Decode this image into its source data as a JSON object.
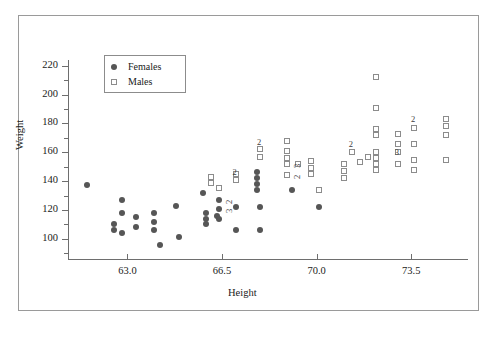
{
  "chart_data": {
    "type": "scatter",
    "title": "",
    "xlabel": "Height",
    "ylabel": "Weight",
    "xlim": [
      60.8,
      75.6
    ],
    "ylim": [
      86,
      224
    ],
    "xticks": [
      "63.0",
      "66.5",
      "70.0",
      "73.5"
    ],
    "xtick_values": [
      63.0,
      66.5,
      70.0,
      73.5
    ],
    "yticks": [
      "100",
      "120",
      "140",
      "160",
      "180",
      "200",
      "220"
    ],
    "ytick_values": [
      100,
      120,
      140,
      160,
      180,
      200,
      220
    ],
    "minor_tick_step_y": 10,
    "grid": false,
    "legend_position": "top-left",
    "series": [
      {
        "name": "Females",
        "marker": "filled-circle",
        "color": "#565656",
        "points": [
          {
            "x": 61.5,
            "y": 137,
            "n": 1
          },
          {
            "x": 62.5,
            "y": 110,
            "n": 1
          },
          {
            "x": 62.5,
            "y": 106,
            "n": 1
          },
          {
            "x": 62.8,
            "y": 127,
            "n": 1
          },
          {
            "x": 62.8,
            "y": 118,
            "n": 1
          },
          {
            "x": 62.8,
            "y": 104,
            "n": 1
          },
          {
            "x": 63.3,
            "y": 115,
            "n": 1
          },
          {
            "x": 63.3,
            "y": 108,
            "n": 1
          },
          {
            "x": 64.0,
            "y": 118,
            "n": 1
          },
          {
            "x": 64.0,
            "y": 112,
            "n": 1
          },
          {
            "x": 64.0,
            "y": 106,
            "n": 1
          },
          {
            "x": 64.2,
            "y": 96,
            "n": 1
          },
          {
            "x": 64.8,
            "y": 123,
            "n": 1
          },
          {
            "x": 64.9,
            "y": 101,
            "n": 1
          },
          {
            "x": 65.8,
            "y": 132,
            "n": 1
          },
          {
            "x": 65.9,
            "y": 118,
            "n": 1
          },
          {
            "x": 65.9,
            "y": 114,
            "n": 1
          },
          {
            "x": 65.9,
            "y": 110,
            "n": 1
          },
          {
            "x": 66.3,
            "y": 116,
            "n": 1
          },
          {
            "x": 66.4,
            "y": 127,
            "n": 2
          },
          {
            "x": 66.4,
            "y": 121,
            "n": 3
          },
          {
            "x": 66.4,
            "y": 114,
            "n": 1
          },
          {
            "x": 67.0,
            "y": 122,
            "n": 1
          },
          {
            "x": 67.0,
            "y": 106,
            "n": 1
          },
          {
            "x": 67.8,
            "y": 146,
            "n": 1
          },
          {
            "x": 67.8,
            "y": 142,
            "n": 1
          },
          {
            "x": 67.8,
            "y": 138,
            "n": 1
          },
          {
            "x": 67.8,
            "y": 134,
            "n": 1
          },
          {
            "x": 67.9,
            "y": 122,
            "n": 1
          },
          {
            "x": 67.9,
            "y": 106,
            "n": 1
          },
          {
            "x": 69.1,
            "y": 134,
            "n": 1
          },
          {
            "x": 70.1,
            "y": 122,
            "n": 1
          }
        ]
      },
      {
        "name": "Males",
        "marker": "open-square",
        "color": "#8c8c8c",
        "points": [
          {
            "x": 66.1,
            "y": 143,
            "n": 1
          },
          {
            "x": 66.1,
            "y": 139,
            "n": 1
          },
          {
            "x": 66.4,
            "y": 135,
            "n": 1
          },
          {
            "x": 67.0,
            "y": 145,
            "n": 1
          },
          {
            "x": 67.0,
            "y": 141,
            "n": 2
          },
          {
            "x": 67.9,
            "y": 162,
            "n": 1
          },
          {
            "x": 67.9,
            "y": 157,
            "n": 2
          },
          {
            "x": 68.9,
            "y": 168,
            "n": 1
          },
          {
            "x": 68.9,
            "y": 161,
            "n": 1
          },
          {
            "x": 68.9,
            "y": 156,
            "n": 1
          },
          {
            "x": 68.9,
            "y": 152,
            "n": 3
          },
          {
            "x": 68.9,
            "y": 144,
            "n": 2
          },
          {
            "x": 69.3,
            "y": 152,
            "n": 1
          },
          {
            "x": 69.8,
            "y": 154,
            "n": 1
          },
          {
            "x": 69.8,
            "y": 149,
            "n": 1
          },
          {
            "x": 69.8,
            "y": 145,
            "n": 1
          },
          {
            "x": 70.1,
            "y": 134,
            "n": 1
          },
          {
            "x": 71.0,
            "y": 152,
            "n": 1
          },
          {
            "x": 71.0,
            "y": 147,
            "n": 1
          },
          {
            "x": 71.0,
            "y": 142,
            "n": 1
          },
          {
            "x": 71.3,
            "y": 160,
            "n": 2
          },
          {
            "x": 71.9,
            "y": 157,
            "n": 1
          },
          {
            "x": 72.2,
            "y": 212,
            "n": 1
          },
          {
            "x": 72.2,
            "y": 191,
            "n": 1
          },
          {
            "x": 72.2,
            "y": 176,
            "n": 1
          },
          {
            "x": 72.2,
            "y": 172,
            "n": 1
          },
          {
            "x": 72.2,
            "y": 160,
            "n": 1
          },
          {
            "x": 72.2,
            "y": 156,
            "n": 1
          },
          {
            "x": 72.2,
            "y": 152,
            "n": 1
          },
          {
            "x": 72.2,
            "y": 148,
            "n": 1
          },
          {
            "x": 71.6,
            "y": 153,
            "n": 1
          },
          {
            "x": 73.0,
            "y": 173,
            "n": 1
          },
          {
            "x": 73.0,
            "y": 166,
            "n": 1
          },
          {
            "x": 73.0,
            "y": 160,
            "n": 3
          },
          {
            "x": 73.0,
            "y": 152,
            "n": 1
          },
          {
            "x": 73.6,
            "y": 177,
            "n": 2
          },
          {
            "x": 73.6,
            "y": 166,
            "n": 1
          },
          {
            "x": 73.6,
            "y": 155,
            "n": 1
          },
          {
            "x": 73.6,
            "y": 148,
            "n": 1
          },
          {
            "x": 74.8,
            "y": 183,
            "n": 1
          },
          {
            "x": 74.8,
            "y": 178,
            "n": 1
          },
          {
            "x": 74.8,
            "y": 172,
            "n": 1
          },
          {
            "x": 74.8,
            "y": 155,
            "n": 1
          }
        ]
      }
    ],
    "count_labels": [
      {
        "x": 66.4,
        "y": 127,
        "text": "2",
        "rotated": true
      },
      {
        "x": 66.4,
        "y": 121,
        "text": "3",
        "rotated": true
      },
      {
        "x": 67.0,
        "y": 146,
        "text": "2",
        "rotated": false
      },
      {
        "x": 67.9,
        "y": 167,
        "text": "2",
        "rotated": false
      },
      {
        "x": 68.9,
        "y": 152,
        "text": "3",
        "rotated": true
      },
      {
        "x": 68.9,
        "y": 144,
        "text": "2",
        "rotated": true
      },
      {
        "x": 71.3,
        "y": 166,
        "text": "2",
        "rotated": false
      },
      {
        "x": 73.0,
        "y": 160,
        "text": "3",
        "rotated": false
      },
      {
        "x": 73.6,
        "y": 183,
        "text": "2",
        "rotated": false
      }
    ]
  },
  "legend": {
    "entries": [
      {
        "label": "Females",
        "marker": "filled-circle"
      },
      {
        "label": "Males",
        "marker": "open-square"
      }
    ]
  }
}
